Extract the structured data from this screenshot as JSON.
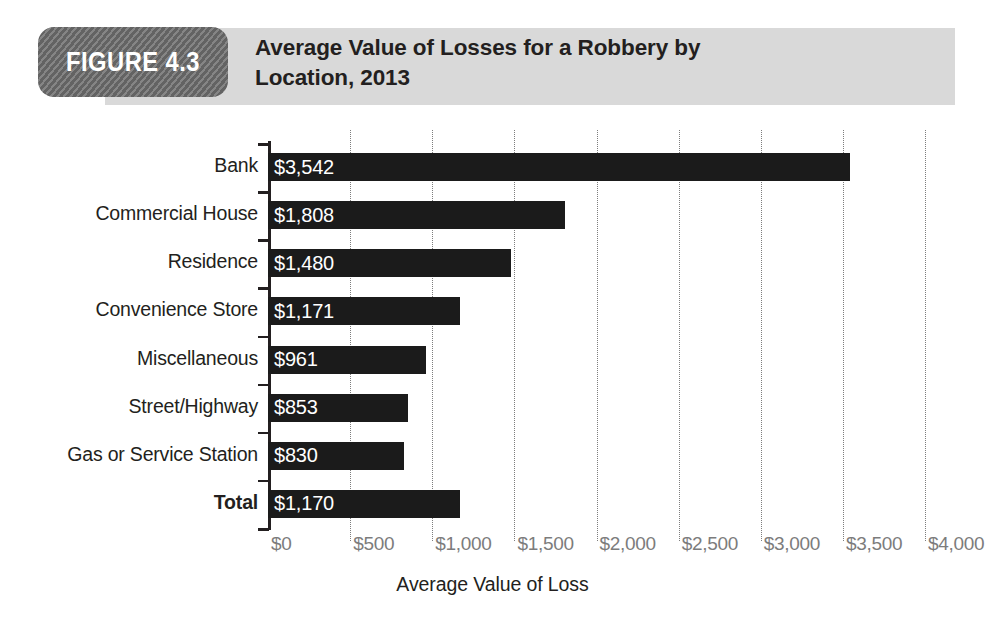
{
  "header": {
    "badge_label": "FIGURE 4.3",
    "title": "Average Value of Losses for a Robbery by Location, 2013",
    "title_line1": "Average Value of Losses for a Robbery by",
    "title_line2": "Location, 2013",
    "badge_color": "#6e6e6e",
    "band_color": "#d9d9d9"
  },
  "chart_data": {
    "type": "bar",
    "orientation": "horizontal",
    "title": "Average Value of Losses for a Robbery by Location, 2013",
    "xlabel": "Average Value of Loss",
    "ylabel": "",
    "xlim": [
      0,
      4000
    ],
    "grid": true,
    "legend": false,
    "bar_color": "#1b1b1b",
    "categories": [
      "Bank",
      "Commercial House",
      "Residence",
      "Convenience Store",
      "Miscellaneous",
      "Street/Highway",
      "Gas or Service Station",
      "Total"
    ],
    "values": [
      3542,
      1808,
      1480,
      1171,
      961,
      853,
      830,
      1170
    ],
    "data_labels": [
      "$3,542",
      "$1,808",
      "$1,480",
      "$1,171",
      "$961",
      "$853",
      "$830",
      "$1,170"
    ],
    "xticks": [
      0,
      500,
      1000,
      1500,
      2000,
      2500,
      3000,
      3500,
      4000
    ],
    "xtick_labels": [
      "$0",
      "$500",
      "$1,000",
      "$1,500",
      "$2,000",
      "$2,500",
      "$3,000",
      "$3,500",
      "$4,000"
    ],
    "emphasized_category": "Total"
  }
}
